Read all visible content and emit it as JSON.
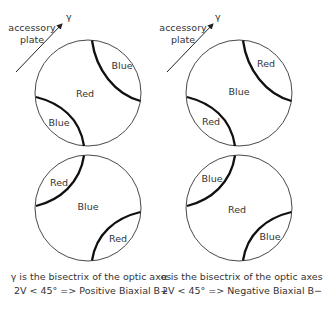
{
  "panels": [
    {
      "id": "positive",
      "accessory_label_line1": "accessory",
      "accessory_label_line2": "plate",
      "axis_symbol": "γ",
      "top_figure": {
        "center_label": "Red",
        "quadrant_upper_right": "Blue",
        "quadrant_lower_left": "Blue"
      },
      "bottom_figure": {
        "center_label": "Blue",
        "quadrant_upper_left": "Red",
        "quadrant_lower_right": "Red"
      },
      "caption_line1": "γ is the bisectrix of the optic axes",
      "caption_line2": "2V < 45° => Positive Biaxial B+"
    },
    {
      "id": "negative",
      "accessory_label_line1": "accessory",
      "accessory_label_line2": "plate",
      "axis_symbol": "γ",
      "top_figure": {
        "center_label": "Blue",
        "quadrant_upper_right": "Red",
        "quadrant_lower_left": "Red"
      },
      "bottom_figure": {
        "center_label": "Red",
        "quadrant_upper_left": "Blue",
        "quadrant_lower_right": "Blue"
      },
      "caption_line1": "α is the bisectrix of the optic axes",
      "caption_line2": "2V < 45° => Negative Biaxial B−"
    }
  ]
}
